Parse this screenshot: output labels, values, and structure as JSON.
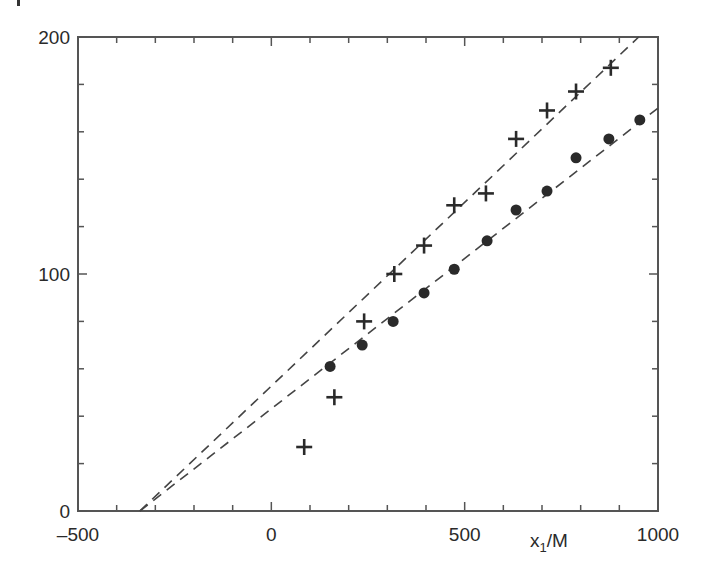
{
  "chart_data": {
    "type": "scatter",
    "title": "",
    "xlabel": "x1/M",
    "xlabel_main": "x",
    "xlabel_sub": "1",
    "xlabel_suffix": "/M",
    "ylabel": "",
    "xlim": [
      -500,
      1000
    ],
    "ylim": [
      0,
      200
    ],
    "x_ticks": [
      -500,
      0,
      500,
      1000
    ],
    "x_tick_labels": [
      "–500",
      "0",
      "500",
      "1000"
    ],
    "x_minor_step": 100,
    "y_ticks": [
      0,
      100,
      200
    ],
    "y_tick_labels": [
      "0",
      "100",
      "200"
    ],
    "y_minor_step": 20,
    "grid": false,
    "legend": null,
    "series": [
      {
        "name": "plus",
        "marker": "+",
        "x": [
          85,
          163,
          240,
          318,
          395,
          473,
          555,
          633,
          713,
          788,
          878
        ],
        "y": [
          27,
          48,
          80,
          100,
          112,
          129,
          134,
          157,
          169,
          177,
          187
        ]
      },
      {
        "name": "dot",
        "marker": "filled-circle",
        "x": [
          152,
          235,
          315,
          395,
          473,
          558,
          633,
          713,
          788,
          873,
          953
        ],
        "y": [
          61,
          70,
          80,
          92,
          102,
          114,
          127,
          135,
          149,
          157,
          165
        ]
      }
    ],
    "fit_lines": [
      {
        "name": "plus-fit",
        "style": "dashed",
        "x": [
          -340,
          950
        ],
        "y": [
          0,
          200
        ]
      },
      {
        "name": "dot-fit",
        "style": "dashed",
        "x": [
          -340,
          1000
        ],
        "y": [
          0,
          170
        ]
      }
    ]
  },
  "colors": {
    "axis": "#555555",
    "marker": "#2a2a2a",
    "line": "#444444",
    "background": "#ffffff"
  }
}
